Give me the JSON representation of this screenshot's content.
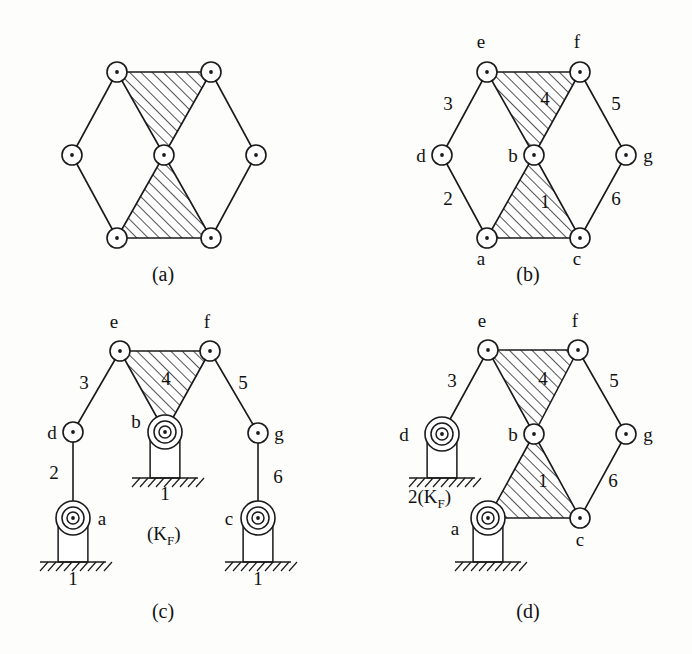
{
  "figure": {
    "background_color": "#fdfdfc",
    "ink_color": "#1a1a1a"
  },
  "panels": [
    {
      "id": "a",
      "caption": "(a)",
      "caption_x": 163,
      "caption_y": 281,
      "description": "Six-bar kinematic chain with two ternary links shown hatched",
      "joints": [
        {
          "name": "top-left",
          "x": 117,
          "y": 72,
          "type": "pin"
        },
        {
          "name": "top-right",
          "x": 211,
          "y": 72,
          "type": "pin"
        },
        {
          "name": "left",
          "x": 72,
          "y": 155,
          "type": "pin"
        },
        {
          "name": "center",
          "x": 164,
          "y": 155,
          "type": "pin"
        },
        {
          "name": "right",
          "x": 256,
          "y": 155,
          "type": "pin"
        },
        {
          "name": "bottom-left",
          "x": 117,
          "y": 238,
          "type": "pin"
        },
        {
          "name": "bottom-right",
          "x": 211,
          "y": 238,
          "type": "pin"
        }
      ],
      "binary_links": [
        [
          "top-left",
          "left"
        ],
        [
          "left",
          "bottom-left"
        ],
        [
          "top-right",
          "right"
        ],
        [
          "right",
          "bottom-right"
        ]
      ],
      "ternary_links": [
        [
          "top-left",
          "top-right",
          "center"
        ],
        [
          "center",
          "bottom-right",
          "bottom-left"
        ]
      ],
      "labels": []
    },
    {
      "id": "b",
      "caption": "(b)",
      "caption_x": 528,
      "caption_y": 281,
      "description": "Same chain with links numbered 1-6 and joints lettered a-g",
      "joints": [
        {
          "name": "e",
          "x": 487,
          "y": 72,
          "type": "pin"
        },
        {
          "name": "f",
          "x": 580,
          "y": 72,
          "type": "pin"
        },
        {
          "name": "d",
          "x": 442,
          "y": 155,
          "type": "pin"
        },
        {
          "name": "b",
          "x": 534,
          "y": 155,
          "type": "pin"
        },
        {
          "name": "g",
          "x": 626,
          "y": 155,
          "type": "pin"
        },
        {
          "name": "a",
          "x": 487,
          "y": 238,
          "type": "pin"
        },
        {
          "name": "c",
          "x": 580,
          "y": 238,
          "type": "pin"
        }
      ],
      "binary_links": [
        [
          "e",
          "d"
        ],
        [
          "d",
          "a"
        ],
        [
          "f",
          "g"
        ],
        [
          "g",
          "c"
        ]
      ],
      "ternary_links": [
        [
          "e",
          "f",
          "b"
        ],
        [
          "b",
          "c",
          "a"
        ]
      ],
      "labels": [
        {
          "text": "e",
          "x": 481,
          "y": 48,
          "anchor": "middle"
        },
        {
          "text": "f",
          "x": 577,
          "y": 48,
          "anchor": "middle"
        },
        {
          "text": "3",
          "x": 448,
          "y": 110,
          "anchor": "middle"
        },
        {
          "text": "4",
          "x": 545,
          "y": 105,
          "anchor": "middle"
        },
        {
          "text": "5",
          "x": 616,
          "y": 110,
          "anchor": "middle"
        },
        {
          "text": "d",
          "x": 421,
          "y": 162,
          "anchor": "middle"
        },
        {
          "text": "b",
          "x": 513,
          "y": 162,
          "anchor": "middle"
        },
        {
          "text": "g",
          "x": 648,
          "y": 162,
          "anchor": "middle"
        },
        {
          "text": "2",
          "x": 448,
          "y": 205,
          "anchor": "middle"
        },
        {
          "text": "1",
          "x": 545,
          "y": 208,
          "anchor": "middle"
        },
        {
          "text": "6",
          "x": 616,
          "y": 205,
          "anchor": "middle"
        },
        {
          "text": "a",
          "x": 481,
          "y": 265,
          "anchor": "middle"
        },
        {
          "text": "c",
          "x": 577,
          "y": 265,
          "anchor": "middle"
        }
      ]
    },
    {
      "id": "c",
      "caption": "(c)",
      "caption_x": 163,
      "caption_y": 618,
      "description": "Inversion with link 1 fixed to ground at three points, link 1 is the frame (K_F)",
      "joints": [
        {
          "name": "e",
          "x": 120,
          "y": 351,
          "type": "pin"
        },
        {
          "name": "f",
          "x": 210,
          "y": 351,
          "type": "pin"
        },
        {
          "name": "d",
          "x": 73,
          "y": 432,
          "type": "pin"
        },
        {
          "name": "b",
          "x": 165,
          "y": 432,
          "type": "ground"
        },
        {
          "name": "g",
          "x": 258,
          "y": 433,
          "type": "pin"
        },
        {
          "name": "a",
          "x": 73,
          "y": 518,
          "type": "ground"
        },
        {
          "name": "c",
          "x": 258,
          "y": 518,
          "type": "ground"
        }
      ],
      "binary_links": [
        [
          "e",
          "d"
        ],
        [
          "d",
          "a"
        ],
        [
          "f",
          "g"
        ],
        [
          "g",
          "c"
        ]
      ],
      "ternary_links": [
        [
          "e",
          "f",
          "b"
        ]
      ],
      "grounds": [
        {
          "joint": "b",
          "x": 165,
          "y": 432,
          "ground_y": 478,
          "half_width": 24,
          "hatch_half_width": 33
        },
        {
          "joint": "a",
          "x": 73,
          "y": 518,
          "ground_y": 562,
          "half_width": 24,
          "hatch_half_width": 33
        },
        {
          "joint": "c",
          "x": 258,
          "y": 518,
          "ground_y": 562,
          "half_width": 24,
          "hatch_half_width": 33
        }
      ],
      "labels": [
        {
          "text": "e",
          "x": 114,
          "y": 328,
          "anchor": "middle"
        },
        {
          "text": "f",
          "x": 207,
          "y": 328,
          "anchor": "middle"
        },
        {
          "text": "3",
          "x": 84,
          "y": 389,
          "anchor": "middle"
        },
        {
          "text": "4",
          "x": 166,
          "y": 385,
          "anchor": "middle"
        },
        {
          "text": "5",
          "x": 243,
          "y": 389,
          "anchor": "middle"
        },
        {
          "text": "d",
          "x": 52,
          "y": 439,
          "anchor": "middle"
        },
        {
          "text": "b",
          "x": 136,
          "y": 428,
          "anchor": "middle"
        },
        {
          "text": "g",
          "x": 279,
          "y": 440,
          "anchor": "middle"
        },
        {
          "text": "2",
          "x": 54,
          "y": 479,
          "anchor": "middle"
        },
        {
          "text": "6",
          "x": 278,
          "y": 483,
          "anchor": "middle"
        },
        {
          "text": "a",
          "x": 102,
          "y": 525,
          "anchor": "middle"
        },
        {
          "text": "c",
          "x": 229,
          "y": 525,
          "anchor": "middle"
        },
        {
          "text": "1",
          "x": 165,
          "y": 500,
          "anchor": "middle"
        },
        {
          "text": "1",
          "x": 73,
          "y": 585,
          "anchor": "middle"
        },
        {
          "text": "1",
          "x": 258,
          "y": 585,
          "anchor": "middle"
        }
      ],
      "kf_label": {
        "text": "(K",
        "sub": "F",
        "tail": ")",
        "x": 147,
        "y": 540
      }
    },
    {
      "id": "d",
      "caption": "(d)",
      "caption_x": 528,
      "caption_y": 618,
      "description": "Inversion with link 2 fixed as the frame, labelled 2(K_F)",
      "joints": [
        {
          "name": "e",
          "x": 488,
          "y": 350,
          "type": "pin"
        },
        {
          "name": "f",
          "x": 578,
          "y": 350,
          "type": "pin"
        },
        {
          "name": "d",
          "x": 442,
          "y": 434,
          "type": "ground"
        },
        {
          "name": "b",
          "x": 534,
          "y": 434,
          "type": "pin"
        },
        {
          "name": "g",
          "x": 626,
          "y": 434,
          "type": "pin"
        },
        {
          "name": "a",
          "x": 488,
          "y": 518,
          "type": "ground"
        },
        {
          "name": "c",
          "x": 580,
          "y": 518,
          "type": "pin"
        }
      ],
      "binary_links": [
        [
          "e",
          "d"
        ],
        [
          "f",
          "g"
        ],
        [
          "g",
          "c"
        ]
      ],
      "ternary_links": [
        [
          "e",
          "f",
          "b"
        ],
        [
          "b",
          "c",
          "a"
        ]
      ],
      "grounds": [
        {
          "joint": "d",
          "x": 442,
          "y": 434,
          "ground_y": 478,
          "half_width": 24,
          "hatch_half_width": 33
        },
        {
          "joint": "a",
          "x": 488,
          "y": 518,
          "ground_y": 562,
          "half_width": 24,
          "hatch_half_width": 33
        }
      ],
      "labels": [
        {
          "text": "e",
          "x": 482,
          "y": 327,
          "anchor": "middle"
        },
        {
          "text": "f",
          "x": 575,
          "y": 327,
          "anchor": "middle"
        },
        {
          "text": "3",
          "x": 452,
          "y": 387,
          "anchor": "middle"
        },
        {
          "text": "4",
          "x": 543,
          "y": 385,
          "anchor": "middle"
        },
        {
          "text": "5",
          "x": 614,
          "y": 387,
          "anchor": "middle"
        },
        {
          "text": "d",
          "x": 404,
          "y": 441,
          "anchor": "middle"
        },
        {
          "text": "b",
          "x": 513,
          "y": 441,
          "anchor": "middle"
        },
        {
          "text": "g",
          "x": 648,
          "y": 441,
          "anchor": "middle"
        },
        {
          "text": "1",
          "x": 543,
          "y": 487,
          "anchor": "middle"
        },
        {
          "text": "6",
          "x": 613,
          "y": 487,
          "anchor": "middle"
        },
        {
          "text": "a",
          "x": 455,
          "y": 535,
          "anchor": "middle"
        },
        {
          "text": "c",
          "x": 580,
          "y": 546,
          "anchor": "middle"
        }
      ],
      "kf_label": {
        "text": "2(K",
        "sub": "F",
        "tail": ")",
        "x": 408,
        "y": 503
      }
    }
  ]
}
